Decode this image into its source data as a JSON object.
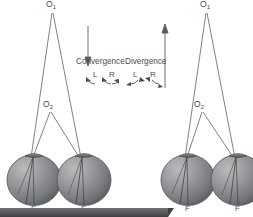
{
  "figure": {
    "background_color": "#ffffff",
    "line_color": "#5a5a5a",
    "label_color": "#4a4a4a",
    "bar_color": "#5c5d60"
  },
  "panels": [
    {
      "id": "left",
      "mode_label": "Convergence",
      "vertical_arrow_direction": "down",
      "eye_labels": {
        "left_eye": "L",
        "right_eye": "R"
      },
      "arrow_direction": "inward",
      "far_point_label": "O",
      "far_point_subscript": "1",
      "near_point_label": "O",
      "near_point_subscript": "2",
      "fovea_label_left": "F",
      "fovea_label_right": "F"
    },
    {
      "id": "right",
      "mode_label": "Divergence",
      "vertical_arrow_direction": "up",
      "eye_labels": {
        "left_eye": "L",
        "right_eye": "R"
      },
      "arrow_direction": "outward",
      "far_point_label": "O",
      "far_point_subscript": "1",
      "near_point_label": "O",
      "near_point_subscript": "2",
      "fovea_label_left": "F",
      "fovea_label_right": "F"
    }
  ]
}
